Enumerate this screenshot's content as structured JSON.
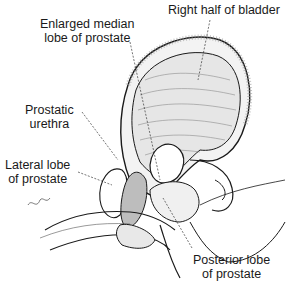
{
  "figure": {
    "type": "anatomical illustration",
    "signature": "Gapin"
  },
  "labels": [
    {
      "id": "bladder",
      "lines": [
        "Right half of bladder"
      ]
    },
    {
      "id": "median-lobe",
      "lines": [
        "Enlarged median",
        "lobe of prostate"
      ]
    },
    {
      "id": "urethra",
      "lines": [
        "Prostatic",
        "urethra"
      ]
    },
    {
      "id": "lateral-lobe",
      "lines": [
        "Lateral lobe",
        "of prostate"
      ]
    },
    {
      "id": "posterior-lobe",
      "lines": [
        "Posterior lobe",
        "of prostate"
      ]
    }
  ],
  "colors": {
    "ink": "#1a1a1a",
    "background": "#ffffff",
    "shade": "#bdbdbd"
  }
}
